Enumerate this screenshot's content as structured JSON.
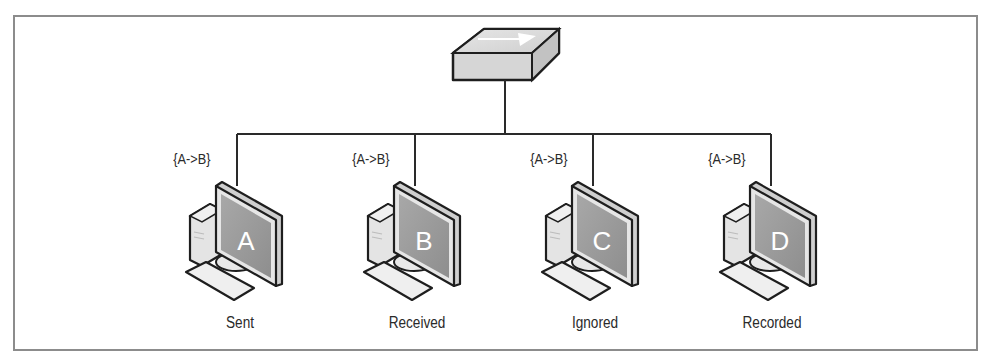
{
  "diagram": {
    "type": "network-bus-broadcast",
    "switch": {
      "icon": "network-hub-icon"
    },
    "message_label": "{A->B}",
    "hosts": [
      {
        "id": "A",
        "letter": "A",
        "message": "{A->B}",
        "caption": "Sent"
      },
      {
        "id": "B",
        "letter": "B",
        "message": "{A->B}",
        "caption": "Received"
      },
      {
        "id": "C",
        "letter": "C",
        "message": "{A->B}",
        "caption": "Ignored"
      },
      {
        "id": "D",
        "letter": "D",
        "message": "{A->B}",
        "caption": "Recorded"
      }
    ]
  },
  "colors": {
    "border": "#8c8c8c",
    "line": "#2a2a2a",
    "screen": "#9a9a9a",
    "device_fill": "#d9d9d9",
    "text": "#2a2a2a"
  }
}
